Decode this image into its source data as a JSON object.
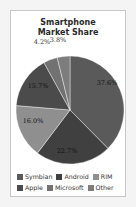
{
  "chart_data": {
    "type": "pie",
    "title": "Smartphone Market Share",
    "title_lines": [
      "Smartphone",
      "Market Share"
    ],
    "categories": [
      "Symbian",
      "Android",
      "RIM",
      "Apple",
      "Microsoft",
      "Other"
    ],
    "values": [
      37.6,
      22.7,
      16.0,
      15.7,
      4.2,
      3.8
    ],
    "labels": [
      "37.6%",
      "22.7%",
      "16.0%",
      "15.7%",
      "4.2%",
      "3.8%"
    ],
    "colors": [
      "#5a5a5a",
      "#404040",
      "#8f8f8f",
      "#4b4b4b",
      "#727272",
      "#7d7d7d"
    ],
    "start_angle_deg": 0,
    "direction": "clockwise",
    "legend_position": "bottom",
    "legend_order": [
      [
        "Symbian",
        "Android",
        "RIM"
      ],
      [
        "Apple",
        "Microsoft",
        "Other"
      ]
    ]
  }
}
